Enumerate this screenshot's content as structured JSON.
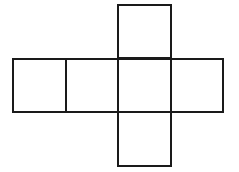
{
  "diagram": {
    "type": "cube-net",
    "stroke_color": "#1a1a1a",
    "background": "#ffffff",
    "squares": [
      {
        "id": "top",
        "x": 117,
        "y": 4,
        "w": 55,
        "h": 55
      },
      {
        "id": "left-outer",
        "x": 12,
        "y": 58,
        "w": 55,
        "h": 55
      },
      {
        "id": "left-inner",
        "x": 65,
        "y": 58,
        "w": 54,
        "h": 55
      },
      {
        "id": "center",
        "x": 117,
        "y": 58,
        "w": 55,
        "h": 55
      },
      {
        "id": "right",
        "x": 170,
        "y": 58,
        "w": 54,
        "h": 55
      },
      {
        "id": "bottom",
        "x": 117,
        "y": 111,
        "w": 55,
        "h": 56
      }
    ]
  }
}
